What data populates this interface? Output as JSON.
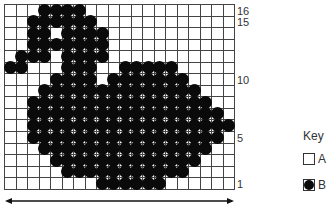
{
  "chart": {
    "columns": 20,
    "rows": 16,
    "row_labels": [
      {
        "row": 16,
        "text": "16"
      },
      {
        "row": 15,
        "text": "15"
      },
      {
        "row": 10,
        "text": "10"
      },
      {
        "row": 5,
        "text": "5"
      },
      {
        "row": 1,
        "text": "1"
      }
    ],
    "filled_cells_by_row": {
      "16": [
        3,
        4,
        5,
        6
      ],
      "15": [
        2,
        3,
        4,
        5,
        6,
        7
      ],
      "14": [
        2,
        3,
        5,
        6,
        7,
        8
      ],
      "13": [
        2,
        3,
        4,
        5,
        6,
        7,
        8
      ],
      "12": [
        1,
        2,
        3,
        5,
        6,
        7,
        8
      ],
      "11": [
        0,
        1,
        5,
        6,
        7,
        10,
        11,
        12,
        13,
        14
      ],
      "10": [
        4,
        5,
        6,
        7,
        9,
        10,
        11,
        12,
        13,
        14,
        15
      ],
      "9": [
        3,
        4,
        5,
        6,
        7,
        8,
        9,
        10,
        11,
        12,
        13,
        14,
        15,
        16
      ],
      "8": [
        2,
        3,
        4,
        5,
        6,
        7,
        8,
        9,
        10,
        11,
        12,
        13,
        14,
        15,
        16,
        17
      ],
      "7": [
        2,
        3,
        4,
        5,
        6,
        7,
        8,
        9,
        10,
        11,
        12,
        13,
        14,
        15,
        16,
        17,
        18
      ],
      "6": [
        2,
        3,
        4,
        5,
        6,
        7,
        8,
        9,
        10,
        11,
        12,
        13,
        14,
        15,
        16,
        17,
        18,
        19
      ],
      "5": [
        2,
        3,
        4,
        5,
        6,
        7,
        8,
        9,
        10,
        11,
        12,
        13,
        14,
        15,
        16,
        17,
        18
      ],
      "4": [
        3,
        4,
        5,
        6,
        7,
        8,
        9,
        10,
        11,
        12,
        13,
        14,
        15,
        16,
        17
      ],
      "3": [
        4,
        5,
        6,
        7,
        8,
        9,
        10,
        11,
        12,
        13,
        14,
        15,
        16
      ],
      "2": [
        5,
        6,
        7,
        8,
        9,
        10,
        11,
        12,
        13,
        14,
        15
      ],
      "1": [
        8,
        9,
        10,
        11,
        12,
        13
      ]
    },
    "width_arrow": "double-headed-arrow"
  },
  "key": {
    "title": "Key",
    "items": [
      {
        "symbol": "empty-square",
        "label": "A",
        "color": "#ffffff"
      },
      {
        "symbol": "filled-circle",
        "label": "B",
        "color": "#0a0a0a"
      }
    ]
  }
}
